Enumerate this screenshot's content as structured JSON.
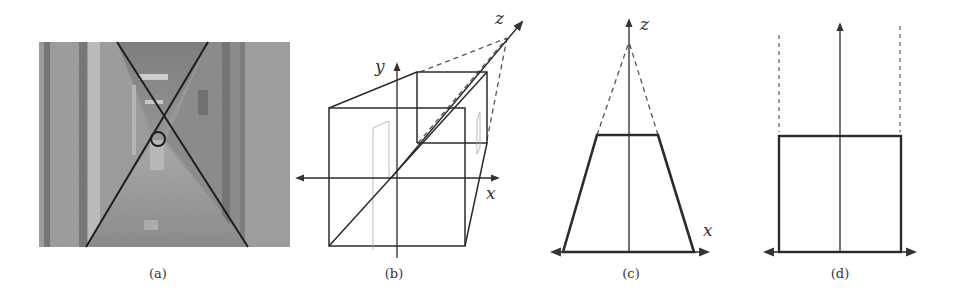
{
  "figure": {
    "panels": [
      {
        "id": "a",
        "caption": "(a)",
        "content": "corridor photograph with two diagonal vanishing lines crossing at a circled vanishing point"
      },
      {
        "id": "b",
        "caption": "(b)",
        "axes": {
          "x": "x",
          "y": "y",
          "z": "z"
        },
        "content": "perspective box showing front face, back face and dashed lines converging to vanishing point along z axis"
      },
      {
        "id": "c",
        "caption": "(c)",
        "axes": {
          "x": "x",
          "z": "z"
        },
        "content": "top view trapezoid with dashed lines converging to z-axis point"
      },
      {
        "id": "d",
        "caption": "(d)",
        "content": "rectified rectangle with parallel dashed vertical lines"
      }
    ]
  },
  "colors": {
    "line": "#2b2b2b",
    "dashed": "#555555",
    "photo_wall": "#9a9a9a",
    "background": "#ffffff"
  }
}
